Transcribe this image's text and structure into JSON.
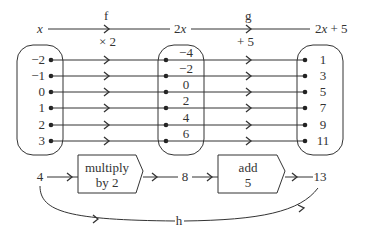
{
  "header": {
    "domain_label": "x",
    "middle_label": "2x",
    "range_label": "2x + 5",
    "f": {
      "name": "f",
      "rule": "× 2"
    },
    "g": {
      "name": "g",
      "rule": "+ 5"
    }
  },
  "sets": {
    "domain": [
      "−2",
      "−1",
      "0",
      "1",
      "2",
      "3"
    ],
    "middle": [
      "−4",
      "−2",
      "0",
      "2",
      "4",
      "6"
    ],
    "range": [
      "1",
      "3",
      "5",
      "7",
      "9",
      "11"
    ]
  },
  "process": {
    "input": "4",
    "step1": {
      "line1": "multiply",
      "line2": "by 2"
    },
    "intermediate": "8",
    "step2": {
      "line1": "add",
      "line2": "5"
    },
    "output": "13",
    "composite_label": "h"
  },
  "colors": {
    "ink": "#333333",
    "background": "#ffffff"
  }
}
